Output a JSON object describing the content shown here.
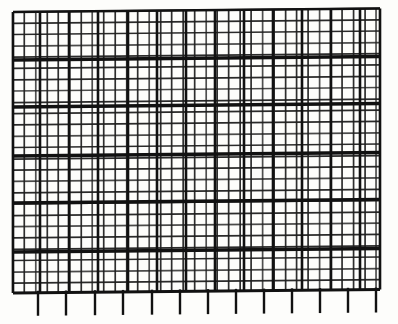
{
  "image": {
    "title": "Wire mesh grid scan",
    "subject": "orthogonal-grid-mesh",
    "width": 398,
    "height": 324,
    "background_color": "#fdfdfb",
    "page_color": "#ffffff",
    "line_color": "#1f1f1f",
    "bold_line_color": "#111111",
    "faint_line_color": "#3a3a3a"
  },
  "grid": {
    "left": 13,
    "top": 12,
    "right": 380,
    "bottom": 293,
    "cell_width": 11.35,
    "cell_height": 11.3,
    "minor_line_width": 1.7,
    "bold_line_width": 3.4,
    "columns": 32,
    "rows": 25,
    "skew_degrees": -0.55,
    "bold_every_columns": 5,
    "bold_every_rows": 4
  },
  "bold_rows": {
    "label": "emphasized horizontal wires",
    "y_positions": [
      60,
      107,
      156,
      203,
      252
    ],
    "line_width": 3.4
  },
  "bold_columns": {
    "label": "emphasized vertical wires",
    "x_positions": [
      13,
      40,
      69,
      98,
      128,
      157,
      186,
      215,
      244,
      273,
      302,
      331,
      360,
      380
    ],
    "line_width": 2.6
  },
  "ticks": {
    "label": "bottom fringe wires",
    "count": 13,
    "top": 293,
    "bottom": 316,
    "line_width": 2.4,
    "x_positions": [
      38,
      66,
      95,
      123,
      152,
      180,
      208,
      236,
      264,
      292,
      320,
      348,
      376
    ]
  },
  "annotations": {
    "caption": "",
    "note": ""
  }
}
